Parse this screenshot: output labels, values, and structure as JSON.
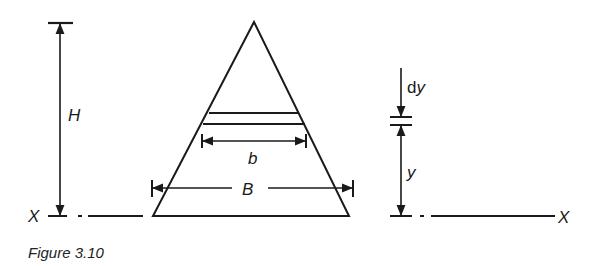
{
  "figure": {
    "caption": "Figure 3.10",
    "labels": {
      "height": "H",
      "strip_width": "b",
      "base_width": "B",
      "strip_thickness_d": "d",
      "strip_thickness_y": "y",
      "distance": "y",
      "axis_left": "X",
      "axis_right": "X"
    },
    "colors": {
      "ink": "#1a1a1a",
      "background": "#ffffff"
    }
  }
}
